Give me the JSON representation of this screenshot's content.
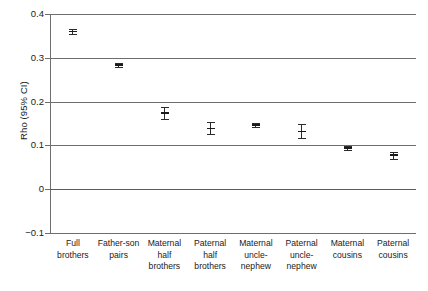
{
  "chart_data": {
    "type": "scatter",
    "title": "",
    "xlabel": "",
    "ylabel": "Rho (95% CI)",
    "ylim": [
      -0.1,
      0.4
    ],
    "yticks": [
      "0.4",
      "0.3",
      "0.2",
      "0.1",
      "0",
      "-0.1"
    ],
    "ytick_values": [
      0.4,
      0.3,
      0.2,
      0.1,
      0,
      -0.1
    ],
    "grid": true,
    "legend": "none",
    "error_bars": "95% CI",
    "categories": [
      "Full brothers",
      "Father-son pairs",
      "Maternal half brothers",
      "Paternal half brothers",
      "Maternal uncle-nephew",
      "Paternal uncle-nephew",
      "Maternal cousins",
      "Paternal cousins"
    ],
    "category_lines": [
      [
        "Full brothers"
      ],
      [
        "Father-son",
        "pairs"
      ],
      [
        "Maternal",
        "half brothers"
      ],
      [
        "Paternal half",
        "brothers"
      ],
      [
        "Maternal",
        "uncle-",
        "nephew"
      ],
      [
        "Paternal",
        "uncle-",
        "nephew"
      ],
      [
        "Maternal",
        "cousins"
      ],
      [
        "Paternal",
        "cousins"
      ]
    ],
    "values": [
      0.36,
      0.283,
      0.174,
      0.139,
      0.147,
      0.132,
      0.094,
      0.078
    ],
    "ci_low": [
      0.354,
      0.278,
      0.161,
      0.125,
      0.143,
      0.116,
      0.089,
      0.07
    ],
    "ci_high": [
      0.366,
      0.288,
      0.187,
      0.153,
      0.151,
      0.148,
      0.099,
      0.086
    ],
    "series": [
      {
        "name": "Rho",
        "values": [
          0.36,
          0.283,
          0.174,
          0.139,
          0.147,
          0.132,
          0.094,
          0.078
        ]
      }
    ]
  },
  "colors": {
    "marker": "#1a1a1a",
    "gridline": "#6e6e6e",
    "axis": "#6e6e6e",
    "background": "#ffffff"
  }
}
